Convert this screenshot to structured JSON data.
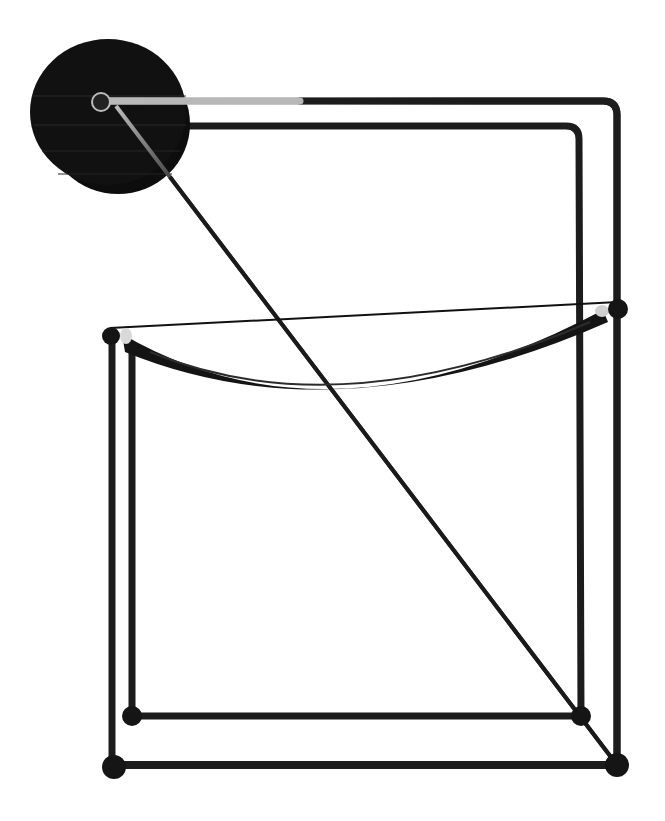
{
  "image": {
    "subject": "Chair",
    "description": "Product photograph of a black tubular steel chair with a round cylindrical backrest, thin diagonal brace, and curved seat, on a white background",
    "background_color": "#ffffff",
    "frame_color": "#1c1c1c",
    "disc_color": "#111111",
    "highlight_color": "#c9c9c9"
  },
  "parts": {
    "backrest": "Cylindrical disc backrest",
    "frame": "Tubular steel frame",
    "seat": "Curved seat",
    "brace": "Diagonal brace",
    "feet": "Ball feet"
  }
}
